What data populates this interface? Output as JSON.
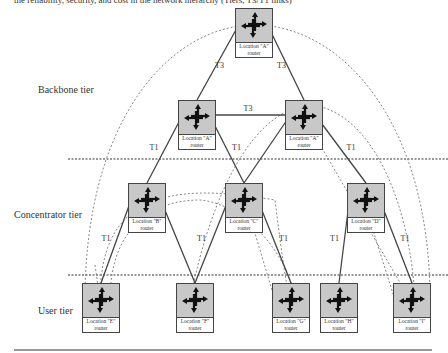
{
  "caption": "the reliability, security, and cost in the network hierarchy (Tiers, T3/T1 links)",
  "tiers": {
    "backbone": "Backbone tier",
    "concentrator": "Concentrator tier",
    "user": "User tier"
  },
  "routers": [
    {
      "id": "top",
      "line1": "Location \"A\"",
      "line2": "router",
      "tier": "backbone"
    },
    {
      "id": "bb-left",
      "line1": "Location \"A\"",
      "line2": "router",
      "tier": "backbone"
    },
    {
      "id": "bb-right",
      "line1": "Location \"A\"",
      "line2": "router",
      "tier": "backbone"
    },
    {
      "id": "B",
      "line1": "Location \"B\"",
      "line2": "router",
      "tier": "concentrator"
    },
    {
      "id": "C",
      "line1": "Location \"C\"",
      "line2": "router",
      "tier": "concentrator"
    },
    {
      "id": "D",
      "line1": "Location \"D\"",
      "line2": "router",
      "tier": "concentrator"
    },
    {
      "id": "E",
      "line1": "Location \"E\"",
      "line2": "router",
      "tier": "user"
    },
    {
      "id": "F",
      "line1": "Location \"F\"",
      "line2": "router",
      "tier": "user"
    },
    {
      "id": "G",
      "line1": "Location \"G\"",
      "line2": "router",
      "tier": "user"
    },
    {
      "id": "H",
      "line1": "Location \"H\"",
      "line2": "router",
      "tier": "user"
    },
    {
      "id": "I",
      "line1": "Location \"I\"",
      "line2": "router",
      "tier": "user"
    }
  ],
  "links": [
    {
      "from": "top",
      "to": "bb-left",
      "label": "T3"
    },
    {
      "from": "top",
      "to": "bb-right",
      "label": "T3"
    },
    {
      "from": "bb-left",
      "to": "bb-right",
      "label": "T3"
    },
    {
      "from": "bb-left",
      "to": "B",
      "label": "T1"
    },
    {
      "from": "bb-left",
      "to": "C",
      "label": "T1"
    },
    {
      "from": "bb-right",
      "to": "C",
      "label": ""
    },
    {
      "from": "bb-right",
      "to": "D",
      "label": "T1"
    },
    {
      "from": "B",
      "to": "E",
      "label": "T1"
    },
    {
      "from": "B",
      "to": "F",
      "label": ""
    },
    {
      "from": "C",
      "to": "F",
      "label": "T1"
    },
    {
      "from": "C",
      "to": "G",
      "label": "T1"
    },
    {
      "from": "D",
      "to": "H",
      "label": "T1"
    },
    {
      "from": "D",
      "to": "I",
      "label": "T1"
    }
  ],
  "colors": {
    "router_fill": "#c8c8c8",
    "line": "#444444",
    "dashed": "#888888"
  }
}
